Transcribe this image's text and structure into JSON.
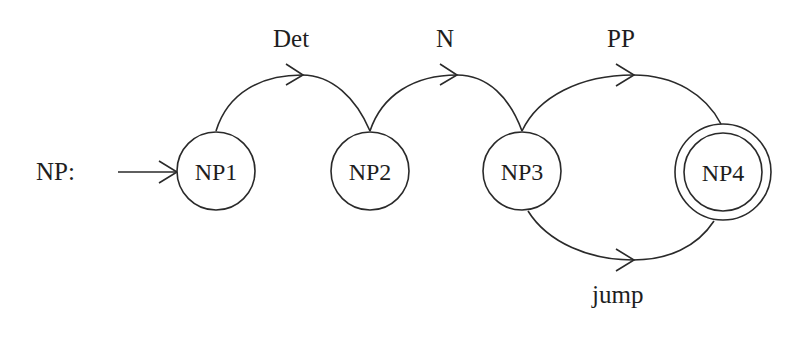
{
  "diagram": {
    "type": "augmented transition network",
    "network_label": "NP:",
    "colors": {
      "stroke": "#2a2a2a",
      "text": "#1e1e1e",
      "background": "#ffffff"
    },
    "nodes": [
      {
        "id": "NP1",
        "label": "NP1",
        "start": true,
        "final": false
      },
      {
        "id": "NP2",
        "label": "NP2",
        "start": false,
        "final": false
      },
      {
        "id": "NP3",
        "label": "NP3",
        "start": false,
        "final": false
      },
      {
        "id": "NP4",
        "label": "NP4",
        "start": false,
        "final": true
      }
    ],
    "edges": [
      {
        "from": "NP1",
        "to": "NP2",
        "label": "Det"
      },
      {
        "from": "NP2",
        "to": "NP3",
        "label": "N"
      },
      {
        "from": "NP3",
        "to": "NP4",
        "label": "PP"
      },
      {
        "from": "NP3",
        "to": "NP4",
        "label": "jump"
      }
    ]
  }
}
